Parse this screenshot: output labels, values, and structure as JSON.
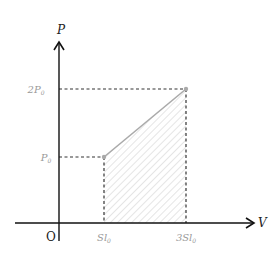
{
  "diagram": {
    "type": "p-v graph",
    "axes": {
      "y_label": "P",
      "x_label": "V",
      "origin_label": "O"
    },
    "ticks": {
      "y": [
        {
          "label": "2P",
          "sub": "0",
          "value": "2P0"
        },
        {
          "label": "P",
          "sub": "0",
          "value": "P0"
        }
      ],
      "x": [
        {
          "label": "Sl",
          "sub": "0",
          "value": "Sl0"
        },
        {
          "label": "3Sl",
          "sub": "0",
          "value": "3Sl0"
        }
      ]
    },
    "points": [
      {
        "name": "A",
        "V": "Sl0",
        "P": "P0"
      },
      {
        "name": "B",
        "V": "3Sl0",
        "P": "2P0"
      }
    ],
    "segment": {
      "from": "A",
      "to": "B",
      "style": "solid gray"
    },
    "shaded_region": {
      "description": "area under segment AB between V=Sl0 and V=3Sl0",
      "pattern": "diagonal hatch"
    },
    "colors": {
      "axis": "#111111",
      "dashed": "#333333",
      "segment": "#aaaaaa",
      "hatch": "#cccccc",
      "tick_label": "#999999",
      "point": "#aaaaaa"
    }
  }
}
